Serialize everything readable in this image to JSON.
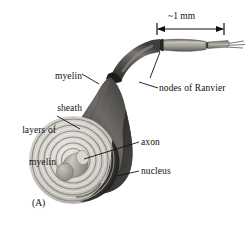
{
  "figure": {
    "panel_label": "(A)",
    "background_color": "#ffffff",
    "ink_color": "#111111",
    "width": 249,
    "height": 227
  },
  "scale_bar": {
    "label": "~1 mm",
    "style": "double-headed-arrow-with-endcaps"
  },
  "labels": [
    {
      "id": "myelin-sheath",
      "line1": "myelin",
      "line2": "sheath"
    },
    {
      "id": "layers-of-myelin",
      "line1": "layers of",
      "line2": "myelin"
    },
    {
      "id": "nodes-of-ranvier",
      "line1": "nodes of Ranvier",
      "line2": ""
    },
    {
      "id": "axon",
      "line1": "axon",
      "line2": ""
    },
    {
      "id": "nucleus",
      "line1": "nucleus",
      "line2": ""
    }
  ],
  "illustration": {
    "subject": "myelinated-nerve-axon",
    "tones": {
      "fiber_dark": "#2f2e2c",
      "fiber_mid": "#6b6764",
      "fiber_light": "#b9b5b0",
      "spiral_light": "#d8d5d0",
      "spiral_line": "#8a8681",
      "axon_body": "#a9a5a0",
      "tail_gray": "#9b9792"
    },
    "spiral_ring_count": 6
  }
}
